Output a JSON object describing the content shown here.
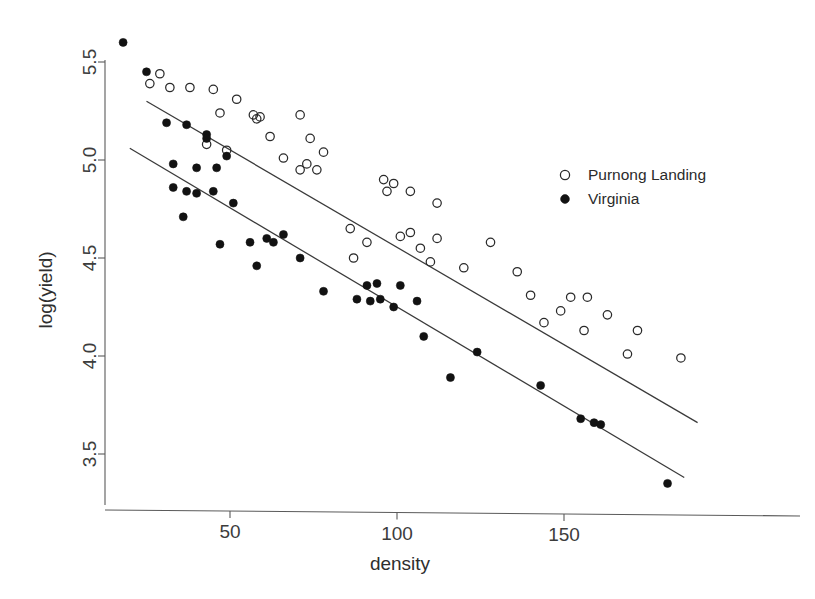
{
  "chart_data": {
    "type": "scatter",
    "title": "",
    "xlabel": "density",
    "ylabel": "log(yield)",
    "xlim": [
      12,
      195
    ],
    "ylim": [
      3.25,
      5.68
    ],
    "xticks": [
      50,
      100,
      150
    ],
    "xtick_labels": [
      "50",
      "100",
      "150"
    ],
    "yticks": [
      3.5,
      4.0,
      4.5,
      5.0,
      5.5
    ],
    "ytick_labels": [
      "3.5",
      "4.0",
      "4.5",
      "5.0",
      "5.5"
    ],
    "grid": false,
    "legend_position": "right-upper",
    "series": [
      {
        "name": "Purnong Landing",
        "marker": "open-circle",
        "color": "#2a2a2a",
        "points": [
          [
            29,
            5.44
          ],
          [
            26,
            5.39
          ],
          [
            32,
            5.37
          ],
          [
            38,
            5.37
          ],
          [
            45,
            5.36
          ],
          [
            52,
            5.31
          ],
          [
            47,
            5.24
          ],
          [
            57,
            5.23
          ],
          [
            59,
            5.22
          ],
          [
            58,
            5.21
          ],
          [
            71,
            5.23
          ],
          [
            43,
            5.08
          ],
          [
            49,
            5.05
          ],
          [
            62,
            5.12
          ],
          [
            74,
            5.11
          ],
          [
            78,
            5.04
          ],
          [
            66,
            5.01
          ],
          [
            73,
            4.98
          ],
          [
            71,
            4.95
          ],
          [
            76,
            4.95
          ],
          [
            96,
            4.9
          ],
          [
            99,
            4.88
          ],
          [
            97,
            4.84
          ],
          [
            104,
            4.84
          ],
          [
            112,
            4.78
          ],
          [
            104,
            4.63
          ],
          [
            101,
            4.61
          ],
          [
            112,
            4.6
          ],
          [
            128,
            4.58
          ],
          [
            107,
            4.55
          ],
          [
            110,
            4.48
          ],
          [
            86,
            4.65
          ],
          [
            91,
            4.58
          ],
          [
            87,
            4.5
          ],
          [
            120,
            4.45
          ],
          [
            136,
            4.43
          ],
          [
            140,
            4.31
          ],
          [
            152,
            4.3
          ],
          [
            157,
            4.3
          ],
          [
            149,
            4.23
          ],
          [
            163,
            4.21
          ],
          [
            144,
            4.17
          ],
          [
            156,
            4.13
          ],
          [
            172,
            4.13
          ],
          [
            169,
            4.01
          ],
          [
            185,
            3.99
          ]
        ]
      },
      {
        "name": "Virginia",
        "marker": "filled-circle",
        "color": "#121212",
        "points": [
          [
            18,
            5.6
          ],
          [
            25,
            5.45
          ],
          [
            31,
            5.19
          ],
          [
            37,
            5.18
          ],
          [
            43,
            5.13
          ],
          [
            43,
            5.11
          ],
          [
            33,
            4.98
          ],
          [
            40,
            4.96
          ],
          [
            46,
            4.96
          ],
          [
            49,
            5.02
          ],
          [
            33,
            4.86
          ],
          [
            37,
            4.84
          ],
          [
            40,
            4.83
          ],
          [
            45,
            4.84
          ],
          [
            36,
            4.71
          ],
          [
            51,
            4.78
          ],
          [
            47,
            4.57
          ],
          [
            56,
            4.58
          ],
          [
            61,
            4.6
          ],
          [
            66,
            4.62
          ],
          [
            63,
            4.58
          ],
          [
            71,
            4.5
          ],
          [
            58,
            4.46
          ],
          [
            78,
            4.33
          ],
          [
            88,
            4.29
          ],
          [
            92,
            4.28
          ],
          [
            95,
            4.29
          ],
          [
            91,
            4.36
          ],
          [
            94,
            4.37
          ],
          [
            99,
            4.25
          ],
          [
            101,
            4.36
          ],
          [
            106,
            4.28
          ],
          [
            108,
            4.1
          ],
          [
            116,
            3.89
          ],
          [
            124,
            4.02
          ],
          [
            143,
            3.85
          ],
          [
            155,
            3.68
          ],
          [
            159,
            3.66
          ],
          [
            161,
            3.65
          ],
          [
            181,
            3.35
          ]
        ]
      }
    ],
    "fit_lines": [
      {
        "series": "Purnong Landing",
        "x_start": 25,
        "y_start": 5.3,
        "x_end": 190,
        "y_end": 3.66
      },
      {
        "series": "Virginia",
        "x_start": 20,
        "y_start": 5.06,
        "x_end": 186,
        "y_end": 3.38
      }
    ]
  },
  "legend": {
    "entries": [
      {
        "label": "Purnong Landing",
        "marker": "open-circle"
      },
      {
        "label": "Virginia",
        "marker": "filled-circle"
      }
    ]
  }
}
